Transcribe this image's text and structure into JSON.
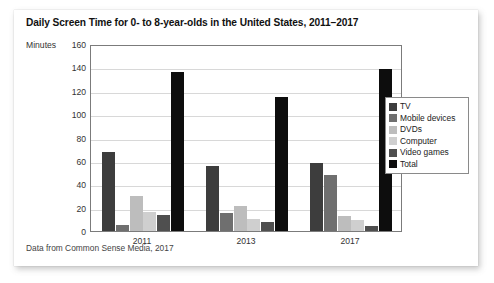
{
  "card": {
    "title": "Daily Screen Time for 0- to 8-year-olds in the United States, 2011–2017",
    "caption": "Data from Common Sense Media, 2017"
  },
  "chart_data": {
    "type": "bar",
    "title": "Daily Screen Time for 0- to 8-year-olds in the United States, 2011–2017",
    "xlabel": "",
    "ylabel": "Minutes",
    "ylim": [
      0,
      160
    ],
    "yticks": [
      0,
      20,
      40,
      60,
      80,
      100,
      120,
      140,
      160
    ],
    "grid": true,
    "legend_position": "right",
    "categories": [
      "2011",
      "2013",
      "2017"
    ],
    "series": [
      {
        "name": "TV",
        "color": "#3d3d3d",
        "values": [
          68,
          56,
          58
        ]
      },
      {
        "name": "Mobile devices",
        "color": "#6f6f6f",
        "values": [
          5,
          15,
          48
        ]
      },
      {
        "name": "DVDs",
        "color": "#bdbdbd",
        "values": [
          30,
          21,
          13
        ]
      },
      {
        "name": "Computer",
        "color": "#cfcfcf",
        "values": [
          16,
          10,
          9
        ]
      },
      {
        "name": "Video games",
        "color": "#4f4f4f",
        "values": [
          14,
          8,
          4
        ]
      },
      {
        "name": "Total",
        "color": "#0d0d0d",
        "values": [
          136,
          115,
          139
        ]
      }
    ],
    "note": "Data from Common Sense Media, 2017"
  }
}
